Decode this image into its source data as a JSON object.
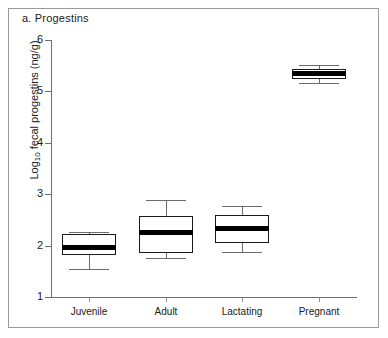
{
  "figure": {
    "panel_title": "a. Progestins",
    "background_color": "#ffffff",
    "frame_color": "#9a9a9a",
    "box_line_color": "#1a1a1a",
    "median_color": "#000000",
    "whisker_color": "#6b6b6b"
  },
  "chart_data": {
    "type": "box",
    "title": "a. Progestins",
    "xlabel": "",
    "ylabel": "Log10 fecal progestins (ng/g)",
    "ylabel_display": "Log",
    "ylabel_sub": "10",
    "ylabel_rest": " fecal progestins (ng/g)",
    "categories": [
      "Juvenile",
      "Adult",
      "Lactating",
      "Pregnant"
    ],
    "ylim": [
      1,
      6
    ],
    "yticks": [
      1,
      2,
      3,
      4,
      5,
      6
    ],
    "ytick_labels": [
      "1",
      "2",
      "3",
      "4",
      "5",
      "6"
    ],
    "grid": false,
    "legend": "none",
    "boxes": [
      {
        "category": "Juvenile",
        "whisker_low": 1.54,
        "q1": 1.82,
        "median": 1.97,
        "q3": 2.23,
        "whisker_high": 2.26
      },
      {
        "category": "Adult",
        "whisker_low": 1.76,
        "q1": 1.86,
        "median": 2.25,
        "q3": 2.58,
        "whisker_high": 2.89
      },
      {
        "category": "Lactating",
        "whisker_low": 1.88,
        "q1": 2.05,
        "median": 2.33,
        "q3": 2.6,
        "whisker_high": 2.77
      },
      {
        "category": "Pregnant",
        "whisker_low": 5.17,
        "q1": 5.24,
        "median": 5.34,
        "q3": 5.44,
        "whisker_high": 5.51
      }
    ]
  }
}
